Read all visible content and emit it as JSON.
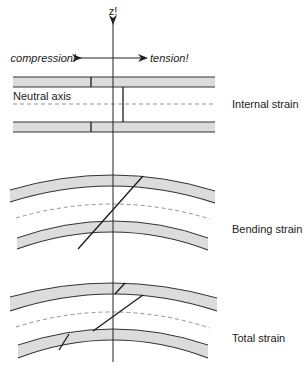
{
  "figure": {
    "width": 306,
    "height": 371,
    "colors": {
      "beam_fill": "#dcdcdc",
      "stroke": "#333333",
      "dash": "#777777",
      "text": "#222222"
    }
  },
  "axis": {
    "label": "z!",
    "x": 113,
    "y_top": 23,
    "y_bottom": 362
  },
  "direction": {
    "left_label": "compression!",
    "right_label": "tension!",
    "y": 58,
    "x_left": 80,
    "x_right": 146
  },
  "panels": [
    {
      "id": "internal",
      "label": "Internal strain",
      "neutral_label": "Neutral axis",
      "type": "straight",
      "x_left": 13,
      "x_right": 215,
      "upper_beam": {
        "top": 77,
        "bottom": 87
      },
      "neutral_y": 104,
      "lower_beam": {
        "top": 122,
        "bottom": 132
      },
      "marks": [
        {
          "x1": 91,
          "y1": 77,
          "x2": 91,
          "y2": 87
        },
        {
          "x1": 123,
          "y1": 87,
          "x2": 123,
          "y2": 122
        },
        {
          "x1": 91,
          "y1": 122,
          "x2": 91,
          "y2": 132
        }
      ]
    },
    {
      "id": "bending",
      "label": "Bending strain",
      "type": "curved",
      "upper_beam": {
        "left": [
          10,
          190,
          202
        ],
        "center": [
          113,
          175,
          186
        ],
        "right": [
          215,
          191,
          203
        ]
      },
      "neutral": {
        "left": [
          16,
          218
        ],
        "center": [
          113,
          204
        ],
        "right": [
          210,
          219
        ]
      },
      "lower_beam": {
        "left": [
          17,
          238,
          249
        ],
        "center": [
          113,
          221,
          232
        ],
        "right": [
          208,
          238,
          250
        ]
      },
      "marks": [
        {
          "x1": 143,
          "y1": 176,
          "x2": 78,
          "y2": 249
        }
      ]
    },
    {
      "id": "total",
      "label": "Total strain",
      "type": "curved",
      "upper_beam": {
        "left": [
          10,
          297,
          311
        ],
        "center": [
          113,
          283,
          294
        ],
        "right": [
          217,
          298,
          311
        ]
      },
      "neutral": {
        "left": [
          16,
          327
        ],
        "center": [
          113,
          312
        ],
        "right": [
          210,
          328
        ]
      },
      "lower_beam": {
        "left": [
          18,
          345,
          358
        ],
        "center": [
          113,
          329,
          340
        ],
        "right": [
          208,
          345,
          358
        ]
      },
      "marks": [
        {
          "x1": 115,
          "y1": 294,
          "x2": 125,
          "y2": 283
        },
        {
          "x1": 143,
          "y1": 295,
          "x2": 93,
          "y2": 331
        },
        {
          "x1": 59,
          "y1": 350,
          "x2": 69,
          "y2": 334
        }
      ]
    }
  ]
}
